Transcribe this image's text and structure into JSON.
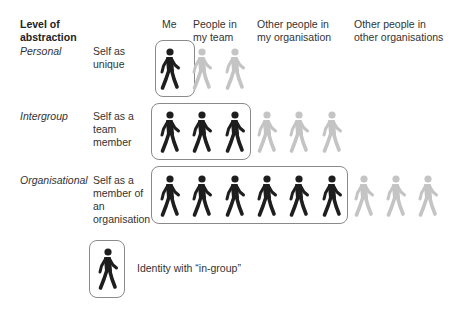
{
  "header": {
    "level_label": "Level of abstraction",
    "columns": [
      "Me",
      "People in my team",
      "Other people in my organisation",
      "Other people in other organisations"
    ]
  },
  "rows": [
    {
      "level": "Personal",
      "description": "Self as unique",
      "in_group_count": 1,
      "out_group_count": 2
    },
    {
      "level": "Intergroup",
      "description": "Self as a team member",
      "in_group_count": 3,
      "out_group_count": 3
    },
    {
      "level": "Organisational",
      "description": "Self as a member of an organisation",
      "in_group_count": 6,
      "out_group_count": 3
    }
  ],
  "legend": {
    "label": "Identity with “in-group”",
    "icon": "walking-person-icon"
  },
  "colors": {
    "in_group": "#1e1e1e",
    "out_group": "#c4c4c4",
    "box_border": "#8a8a8a",
    "text": "#333333"
  }
}
